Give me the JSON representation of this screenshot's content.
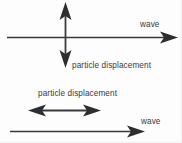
{
  "figure": {
    "background_color": "#fdfdfd",
    "stroke_color": "#3a3a3a",
    "text_color": "#3a3a3a"
  },
  "diagrams": [
    {
      "name": "transverse-wave",
      "wave_label": "wave",
      "displacement_label": "particle displacement",
      "wave_arrow": {
        "orientation": "horizontal",
        "direction": "right",
        "x1": 7,
        "y1": 37,
        "x2": 178,
        "y2": 37
      },
      "displacement_arrow": {
        "orientation": "vertical",
        "direction": "double",
        "x1": 65,
        "y1": 2,
        "x2": 65,
        "y2": 68
      }
    },
    {
      "name": "longitudinal-wave",
      "wave_label": "wave",
      "displacement_label": "particle displacement",
      "wave_arrow": {
        "orientation": "horizontal",
        "direction": "right",
        "x1": 10,
        "y1": 131,
        "x2": 145,
        "y2": 131
      },
      "displacement_arrow": {
        "orientation": "horizontal",
        "direction": "double",
        "x1": 28,
        "y1": 110,
        "x2": 101,
        "y2": 110
      }
    }
  ],
  "labels": {
    "wave_transverse": "wave",
    "particle_displacement_transverse": "particle displacement",
    "particle_displacement_longitudinal": "particle displacement",
    "wave_longitudinal": "wave"
  }
}
